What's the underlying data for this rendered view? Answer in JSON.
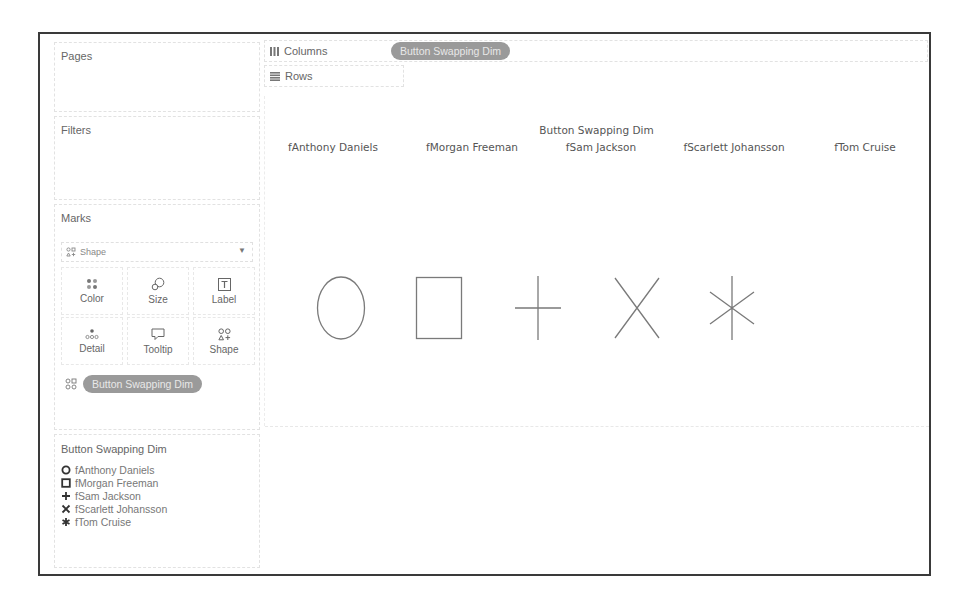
{
  "panels": {
    "pages": {
      "title": "Pages"
    },
    "filters": {
      "title": "Filters"
    },
    "marks": {
      "title": "Marks",
      "mark_type": "Shape",
      "buttons": [
        {
          "label": "Color",
          "icon": "color-icon"
        },
        {
          "label": "Size",
          "icon": "size-icon"
        },
        {
          "label": "Label",
          "icon": "label-icon"
        },
        {
          "label": "Detail",
          "icon": "detail-icon"
        },
        {
          "label": "Tooltip",
          "icon": "tooltip-icon"
        },
        {
          "label": "Shape",
          "icon": "shape-icon"
        }
      ],
      "shape_field": "Button Swapping Dim"
    },
    "legend": {
      "title": "Button Swapping Dim",
      "items": [
        {
          "label": "fAnthony Daniels",
          "shape": "circle"
        },
        {
          "label": "fMorgan Freeman",
          "shape": "square"
        },
        {
          "label": "fSam Jackson",
          "shape": "plus"
        },
        {
          "label": "fScarlett Johansson",
          "shape": "cross"
        },
        {
          "label": "fTom Cruise",
          "shape": "asterisk"
        }
      ]
    }
  },
  "shelves": {
    "columns": {
      "label": "Columns",
      "pill": "Button Swapping Dim"
    },
    "rows": {
      "label": "Rows"
    }
  },
  "view": {
    "header_title": "Button Swapping Dim",
    "columns": [
      {
        "label": "fAnthony Daniels",
        "shape": "circle"
      },
      {
        "label": "fMorgan Freeman",
        "shape": "square"
      },
      {
        "label": "fSam Jackson",
        "shape": "plus"
      },
      {
        "label": "fScarlett Johansson",
        "shape": "cross"
      },
      {
        "label": "fTom Cruise",
        "shape": "asterisk"
      }
    ],
    "mark_color": "#7a7a7a"
  }
}
